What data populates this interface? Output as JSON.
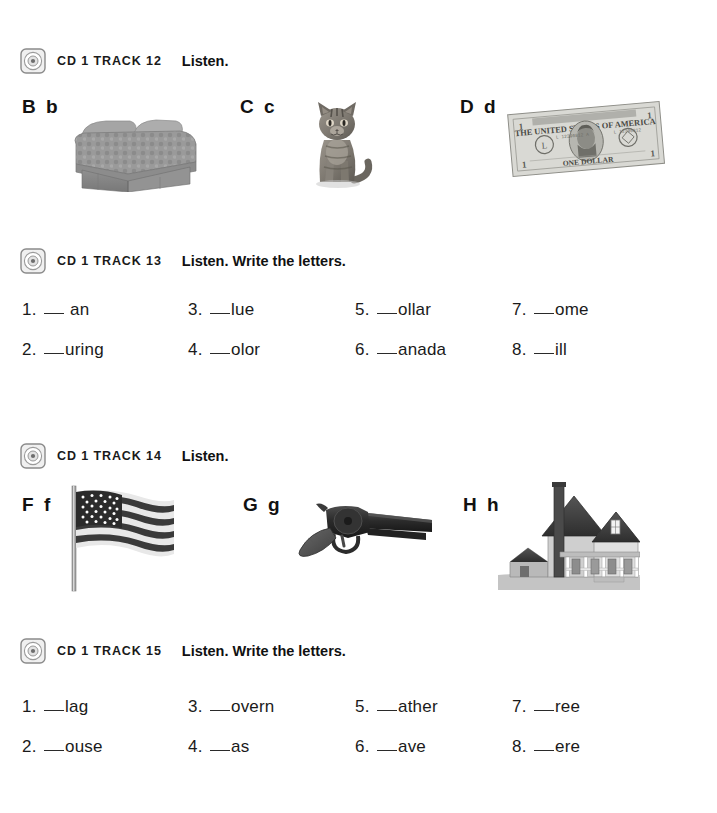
{
  "page": {
    "background_color": "#ffffff",
    "text_color": "#1a1a1a"
  },
  "sections": [
    {
      "id": "track-12",
      "icon": "cd-icon",
      "track_label": "CD 1 TRACK 12",
      "instruction": "Listen.",
      "type": "letters",
      "letters": [
        {
          "label": "B b",
          "picture": "bed-photo",
          "picture_alt": "bed"
        },
        {
          "label": "C c",
          "picture": "cat-photo",
          "picture_alt": "cat"
        },
        {
          "label": "D d",
          "picture": "dollar-photo",
          "picture_alt": "one dollar bill"
        }
      ]
    },
    {
      "id": "track-13",
      "icon": "cd-icon",
      "track_label": "CD 1 TRACK 13",
      "instruction": "Listen. Write the letters.",
      "type": "fill-in",
      "items": [
        {
          "number": "1.",
          "blank_gap": true,
          "word": "an"
        },
        {
          "number": "2.",
          "blank_gap": false,
          "word": "uring"
        },
        {
          "number": "3.",
          "blank_gap": false,
          "word": "lue"
        },
        {
          "number": "4.",
          "blank_gap": false,
          "word": "olor"
        },
        {
          "number": "5.",
          "blank_gap": false,
          "word": "ollar"
        },
        {
          "number": "6.",
          "blank_gap": false,
          "word": "anada"
        },
        {
          "number": "7.",
          "blank_gap": false,
          "word": "ome"
        },
        {
          "number": "8.",
          "blank_gap": false,
          "word": "ill"
        }
      ]
    },
    {
      "id": "track-14",
      "icon": "cd-icon",
      "track_label": "CD 1 TRACK 14",
      "instruction": "Listen.",
      "type": "letters",
      "letters": [
        {
          "label": "F f",
          "picture": "flag-photo",
          "picture_alt": "American flag"
        },
        {
          "label": "G g",
          "picture": "gun-photo",
          "picture_alt": "gun"
        },
        {
          "label": "H h",
          "picture": "house-photo",
          "picture_alt": "house"
        }
      ]
    },
    {
      "id": "track-15",
      "icon": "cd-icon",
      "track_label": "CD 1 TRACK 15",
      "instruction": "Listen. Write the letters.",
      "type": "fill-in",
      "items": [
        {
          "number": "1.",
          "blank_gap": false,
          "word": "lag"
        },
        {
          "number": "2.",
          "blank_gap": false,
          "word": "ouse"
        },
        {
          "number": "3.",
          "blank_gap": false,
          "word": "overn"
        },
        {
          "number": "4.",
          "blank_gap": false,
          "word": "as"
        },
        {
          "number": "5.",
          "blank_gap": false,
          "word": "ather"
        },
        {
          "number": "6.",
          "blank_gap": false,
          "word": "ave"
        },
        {
          "number": "7.",
          "blank_gap": false,
          "word": "ree"
        },
        {
          "number": "8.",
          "blank_gap": false,
          "word": "ere"
        }
      ]
    }
  ],
  "dollar_bill_text": {
    "top": "THE UNITED STATES OF AMERICA",
    "bottom": "ONE DOLLAR",
    "denomination": "1"
  }
}
